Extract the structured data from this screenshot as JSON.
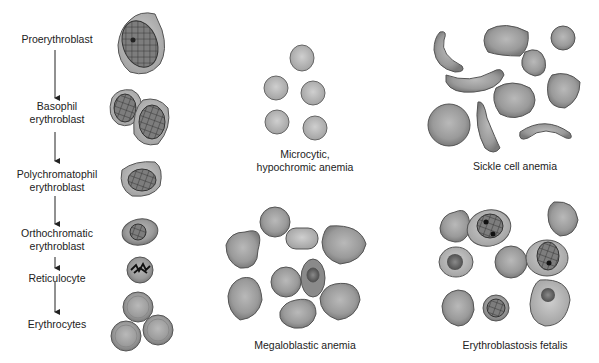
{
  "erythropoiesis": {
    "stages": [
      {
        "line1": "Proerythroblast",
        "line2": ""
      },
      {
        "line1": "Basophil",
        "line2": "erythroblast"
      },
      {
        "line1": "Polychromatophil",
        "line2": "erythroblast"
      },
      {
        "line1": "Orthochromatic",
        "line2": "erythroblast"
      },
      {
        "line1": "Reticulocyte",
        "line2": ""
      },
      {
        "line1": "Erythrocytes",
        "line2": ""
      }
    ]
  },
  "panels": {
    "microcytic": {
      "line1": "Microcytic,",
      "line2": "hypochromic anemia"
    },
    "sickle": {
      "label": "Sickle cell anemia"
    },
    "megaloblastic": {
      "label": "Megaloblastic anemia"
    },
    "erythroblastosis": {
      "label": "Erythroblastosis fetalis"
    }
  },
  "colors": {
    "cell_fill": "#8f8f8f",
    "cell_light": "#b8b8b8",
    "cell_edge": "#555555",
    "nucleus": "#4a4a4a",
    "text": "#222222"
  }
}
